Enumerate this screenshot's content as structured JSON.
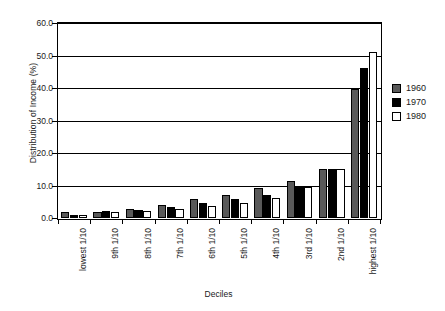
{
  "chart_data": {
    "type": "bar",
    "title": "",
    "xlabel": "Deciles",
    "ylabel": "Distribution of Income (%)",
    "categories": [
      "lowest 1/10",
      "9th 1/10",
      "8th 1/10",
      "7th 1/10",
      "6th 1/10",
      "5th 1/10",
      "4th 1/10",
      "3rd 1/10",
      "2nd 1/10",
      "highest 1/10"
    ],
    "series": [
      {
        "name": "1960",
        "color": "#595959",
        "values": [
          1.8,
          1.8,
          2.8,
          4.0,
          5.9,
          7.2,
          9.1,
          11.3,
          15.0,
          39.7
        ]
      },
      {
        "name": "1970",
        "color": "#000000",
        "values": [
          0.9,
          2.1,
          2.5,
          3.5,
          4.5,
          5.8,
          7.1,
          9.6,
          15.0,
          46.2
        ]
      },
      {
        "name": "1980",
        "color": "#ffffff",
        "values": [
          1.0,
          1.8,
          2.3,
          2.9,
          3.6,
          4.7,
          6.2,
          9.5,
          15.0,
          51.2
        ]
      }
    ],
    "ylim": [
      0,
      60
    ],
    "ytick_labels": [
      "0.0",
      "10.0",
      "20.0",
      "30.0",
      "40.0",
      "50.0",
      "60.0"
    ],
    "ytick_values": [
      0,
      10,
      20,
      30,
      40,
      50,
      60
    ],
    "grid": true,
    "legend_position": "right",
    "legend_entries": [
      "1960",
      "1970",
      "1980"
    ]
  }
}
